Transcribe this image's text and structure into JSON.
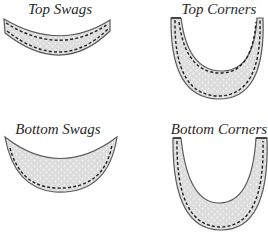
{
  "diagram": {
    "panels": [
      {
        "id": "top-swags",
        "label": "Top Swags"
      },
      {
        "id": "top-corners",
        "label": "Top Corners"
      },
      {
        "id": "bottom-swags",
        "label": "Bottom Swags"
      },
      {
        "id": "bottom-corners",
        "label": "Bottom Corners"
      }
    ],
    "colors": {
      "fill": "#dcdcdc",
      "dot": "#f4f4f4",
      "outline": "#5a5a5a",
      "stitch": "#1e1e1e",
      "label": "#2a2a2a"
    }
  }
}
